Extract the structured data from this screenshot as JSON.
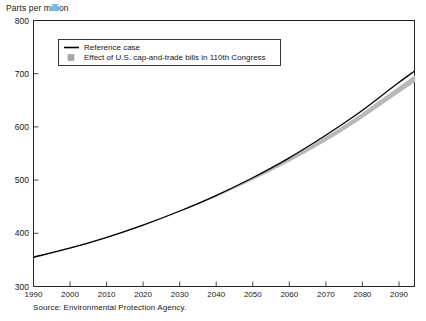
{
  "chart_data": {
    "type": "line",
    "title": "",
    "xlabel": "",
    "ylabel": "Parts per million",
    "xlim": [
      1990,
      2095
    ],
    "ylim": [
      300,
      800
    ],
    "yticks": [
      300,
      400,
      500,
      600,
      700,
      800
    ],
    "xticks": [
      1990,
      2000,
      2010,
      2020,
      2030,
      2040,
      2050,
      2060,
      2070,
      2080,
      2090
    ],
    "grid": false,
    "legend_position": "upper-left",
    "x": [
      1990,
      2000,
      2010,
      2020,
      2030,
      2040,
      2050,
      2060,
      2070,
      2080,
      2090,
      2095
    ],
    "series": [
      {
        "name": "Reference case",
        "type": "line",
        "color": "#000000",
        "values": [
          355,
          372,
          392,
          415,
          441,
          470,
          503,
          540,
          582,
          628,
          680,
          705
        ]
      },
      {
        "name": "Effect of U.S. cap-and-trade bills in 110th Congress",
        "type": "band",
        "color": "#b8b8b8",
        "upper": [
          355,
          372,
          392,
          415,
          441,
          470,
          502,
          538,
          578,
          622,
          671,
          695
        ],
        "lower": [
          355,
          372,
          392,
          415,
          441,
          469,
          500,
          534,
          572,
          615,
          662,
          685
        ]
      }
    ],
    "annotations": []
  },
  "axes": {
    "y_title": "Parts per million",
    "y_tick_labels": [
      "800",
      "700",
      "600",
      "500",
      "400",
      "300"
    ],
    "x_tick_labels": [
      "1990",
      "2000",
      "2010",
      "2020",
      "2030",
      "2040",
      "2050",
      "2060",
      "2070",
      "2080",
      "2090"
    ]
  },
  "legend": {
    "entries": [
      {
        "label": "Reference case",
        "swatch": "line-swatch",
        "color": "#000000"
      },
      {
        "label": "Effect of U.S. cap-and-trade bills in 110th Congress",
        "swatch": "square-swatch",
        "color": "#b0b0b0"
      }
    ]
  },
  "footer": {
    "source": "Source: Environmental Protection Agency."
  },
  "colors": {
    "reference_line": "#000000",
    "band_fill": "#c4c4c4",
    "frame": "#222222",
    "text": "#161616"
  }
}
